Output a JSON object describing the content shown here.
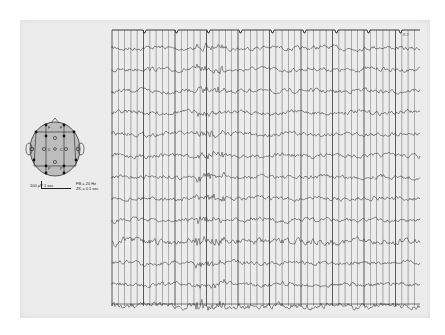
{
  "figure": {
    "type": "EEG recording",
    "channel_count": 13,
    "corner_label": "8.2"
  },
  "legend": {
    "amplitude_scale": "100 µV",
    "time_scale": "1 sec",
    "filter": "FB = 20 Hz",
    "time_constant": "ZK = 0.1 sec"
  },
  "head_diagram": {
    "electrode_labels": [
      "F",
      "F",
      "C",
      "C",
      "P",
      "P",
      "O",
      "O",
      "T",
      "T"
    ]
  },
  "colors": {
    "paper": "#ececec",
    "ink": "#2a2a2a",
    "grid": "#3a3a3a",
    "head_fill": "#bdbdbd"
  }
}
